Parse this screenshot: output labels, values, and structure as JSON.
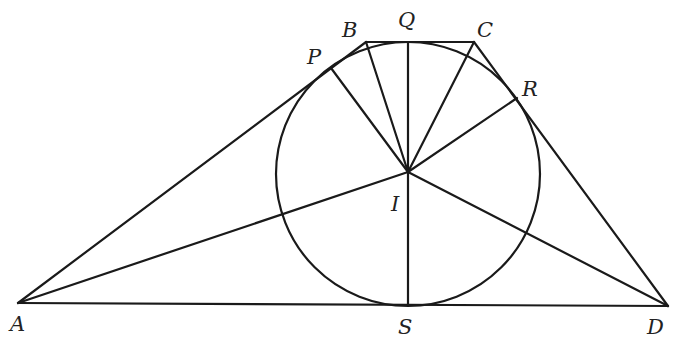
{
  "top_cutoff_text": "y  p",
  "points": {
    "A": {
      "x": 18,
      "y": 303
    },
    "B": {
      "x": 366,
      "y": 42
    },
    "C": {
      "x": 474,
      "y": 42
    },
    "D": {
      "x": 668,
      "y": 306
    },
    "I": {
      "x": 408,
      "y": 172
    },
    "P": {
      "x": 331,
      "y": 68
    },
    "Q": {
      "x": 408,
      "y": 42
    },
    "R": {
      "x": 517,
      "y": 98
    },
    "S": {
      "x": 408,
      "y": 305
    }
  },
  "circle": {
    "cx": 408,
    "cy": 174,
    "r": 132
  },
  "labels": [
    {
      "text": "A",
      "x": 10,
      "y": 331
    },
    {
      "text": "B",
      "x": 342,
      "y": 37
    },
    {
      "text": "Q",
      "x": 398,
      "y": 27
    },
    {
      "text": "C",
      "x": 477,
      "y": 37
    },
    {
      "text": "P",
      "x": 307,
      "y": 64
    },
    {
      "text": "R",
      "x": 522,
      "y": 96
    },
    {
      "text": "I",
      "x": 391,
      "y": 211
    },
    {
      "text": "S",
      "x": 398,
      "y": 334
    },
    {
      "text": "D",
      "x": 647,
      "y": 334
    }
  ],
  "segments": [
    [
      "A",
      "B"
    ],
    [
      "B",
      "C"
    ],
    [
      "C",
      "D"
    ],
    [
      "A",
      "D"
    ],
    [
      "I",
      "A"
    ],
    [
      "I",
      "B"
    ],
    [
      "I",
      "C"
    ],
    [
      "I",
      "D"
    ],
    [
      "I",
      "P"
    ],
    [
      "I",
      "Q"
    ],
    [
      "I",
      "R"
    ],
    [
      "I",
      "S"
    ]
  ]
}
